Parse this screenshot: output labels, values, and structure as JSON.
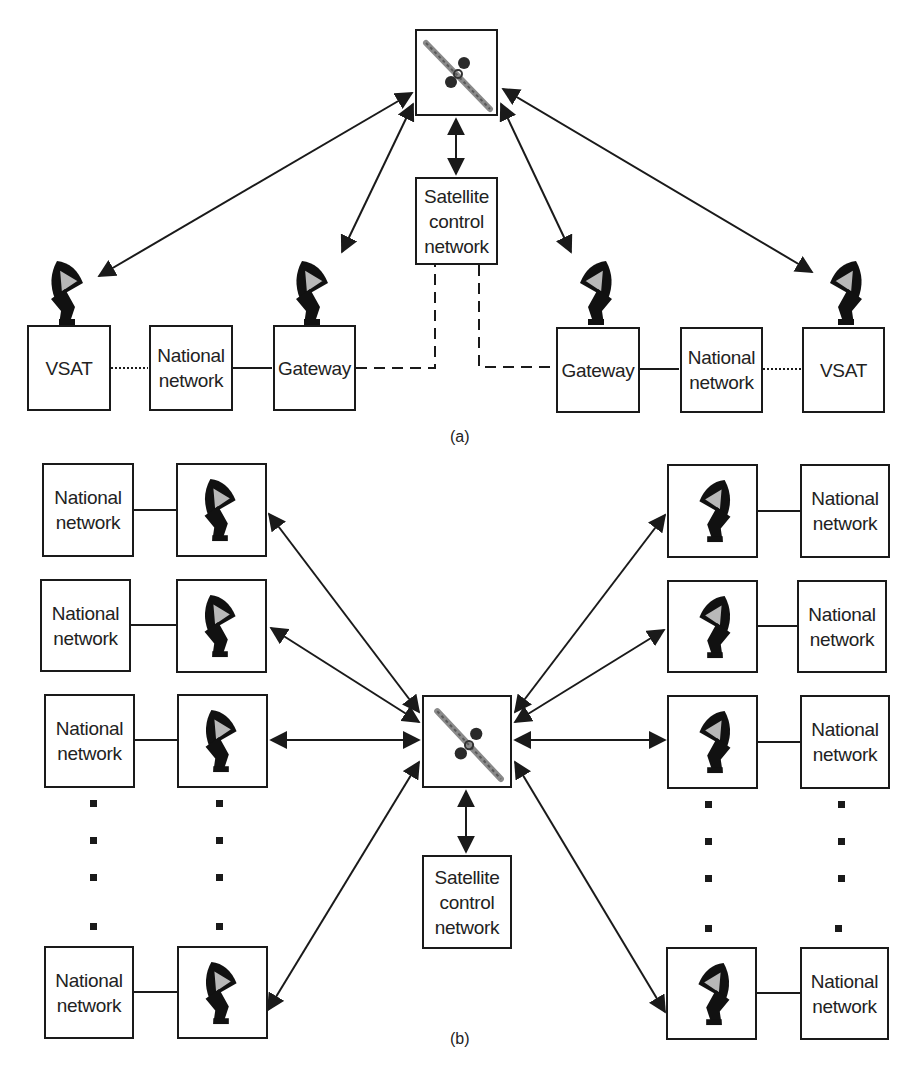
{
  "part_a": {
    "caption": "(a)",
    "satellite_control_network": "Satellite\ncontrol\nnetwork",
    "left": {
      "vsat": "VSAT",
      "national_network": "National\nnetwork",
      "gateway": "Gateway"
    },
    "right": {
      "gateway": "Gateway",
      "national_network": "National\nnetwork",
      "vsat": "VSAT"
    },
    "links": {
      "vsat_to_national": "dotted",
      "national_to_gateway": "solid",
      "gateway_to_control": "dashed",
      "satellite_links": "bidirectional arrows"
    }
  },
  "part_b": {
    "caption": "(b)",
    "satellite_control_network": "Satellite\ncontrol\nnetwork",
    "left_rows": [
      {
        "national_network": "National\nnetwork"
      },
      {
        "national_network": "National\nnetwork"
      },
      {
        "national_network": "National\nnetwork"
      },
      {
        "national_network": "National\nnetwork"
      }
    ],
    "right_rows": [
      {
        "national_network": "National\nnetwork"
      },
      {
        "national_network": "National\nnetwork"
      },
      {
        "national_network": "National\nnetwork"
      },
      {
        "national_network": "National\nnetwork"
      }
    ],
    "ellipsis": "vertical dotted continuation"
  },
  "icons": {
    "satellite": "satellite-icon",
    "dish": "satellite-dish-icon"
  },
  "colors": {
    "stroke": "#1a1a1a",
    "dish_fill": "#111111",
    "dish_highlight": "#b8b8b8",
    "satellite_panel": "#888888",
    "background": "#ffffff"
  }
}
